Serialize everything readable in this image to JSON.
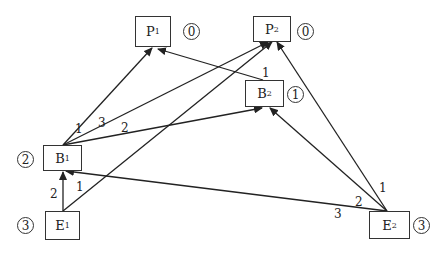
{
  "nodes": [
    {
      "id": "P1",
      "letter": "P",
      "sub": "1",
      "badge": "0",
      "x": 135,
      "y": 16,
      "w": 36,
      "h": 31,
      "bx": 183,
      "by": 23
    },
    {
      "id": "P2",
      "letter": "P",
      "sub": "2",
      "badge": "0",
      "x": 253,
      "y": 16,
      "w": 38,
      "h": 26,
      "bx": 297,
      "by": 23
    },
    {
      "id": "B2",
      "letter": "B",
      "sub": "2",
      "badge": "1",
      "x": 245,
      "y": 80,
      "w": 39,
      "h": 27,
      "bx": 287,
      "by": 86
    },
    {
      "id": "B1",
      "letter": "B",
      "sub": "1",
      "badge": "2",
      "x": 43,
      "y": 145,
      "w": 39,
      "h": 26,
      "bx": 17,
      "by": 151
    },
    {
      "id": "E1",
      "letter": "E",
      "sub": "1",
      "badge": "3",
      "x": 45,
      "y": 211,
      "w": 35,
      "h": 29,
      "bx": 17,
      "by": 217
    },
    {
      "id": "E2",
      "letter": "E",
      "sub": "2",
      "badge": "3",
      "x": 369,
      "y": 211,
      "w": 41,
      "h": 28,
      "bx": 413,
      "by": 217
    }
  ],
  "edges": [
    {
      "from": "B1",
      "to": "P1",
      "weight": "1",
      "x1": 63,
      "y1": 145,
      "x2": 152,
      "y2": 48,
      "lx": 75,
      "ly": 123
    },
    {
      "from": "B1",
      "to": "P2",
      "weight": "3",
      "x1": 63,
      "y1": 145,
      "x2": 268,
      "y2": 42,
      "lx": 98,
      "ly": 117
    },
    {
      "from": "B1",
      "to": "B2",
      "weight": "2",
      "x1": 63,
      "y1": 145,
      "x2": 262,
      "y2": 108,
      "lx": 121,
      "ly": 122
    },
    {
      "from": "B2",
      "to": "P1",
      "weight": "1",
      "x1": 263,
      "y1": 80,
      "x2": 158,
      "y2": 49,
      "lx": 262,
      "ly": 67
    },
    {
      "from": "E1",
      "to": "B1",
      "weight": "2",
      "x1": 63,
      "y1": 211,
      "x2": 63,
      "y2": 172,
      "lx": 50,
      "ly": 188
    },
    {
      "from": "E1",
      "to": "P2",
      "weight": "1",
      "x1": 63,
      "y1": 211,
      "x2": 272,
      "y2": 42,
      "lx": 76,
      "ly": 181
    },
    {
      "from": "E2",
      "to": "B1",
      "weight": "3",
      "x1": 387,
      "y1": 211,
      "x2": 66,
      "y2": 171,
      "lx": 334,
      "ly": 208
    },
    {
      "from": "E2",
      "to": "B2",
      "weight": "2",
      "x1": 387,
      "y1": 211,
      "x2": 270,
      "y2": 108,
      "lx": 355,
      "ly": 196
    },
    {
      "from": "E2",
      "to": "P2",
      "weight": "1",
      "x1": 387,
      "y1": 211,
      "x2": 277,
      "y2": 42,
      "lx": 379,
      "ly": 182
    }
  ]
}
